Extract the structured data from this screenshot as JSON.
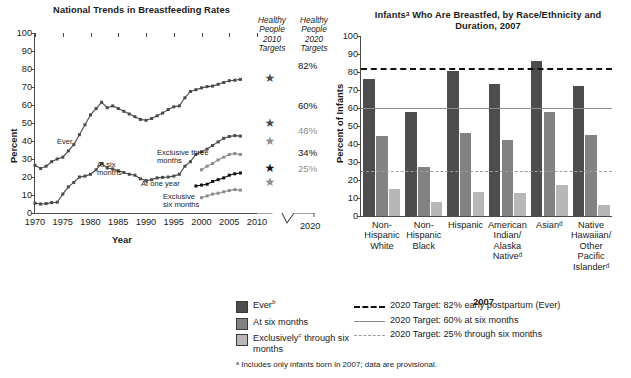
{
  "chart_data": [
    {
      "id": "left",
      "type": "line",
      "title": "National Trends in Breastfeeding Rates",
      "xlabel": "Year",
      "ylabel": "Percent",
      "ylim": [
        0,
        100
      ],
      "yticks": [
        0,
        10,
        20,
        30,
        40,
        50,
        60,
        70,
        80,
        90,
        100
      ],
      "xlim": [
        1970,
        2010
      ],
      "xticks": [
        1970,
        1975,
        1980,
        1985,
        1990,
        1995,
        2000,
        2005,
        2010
      ],
      "axis_break_label": "2020",
      "grid": false,
      "legend": "inline-labels",
      "series": [
        {
          "name": "Ever",
          "label": "Ever",
          "color": "#4a4a4a",
          "x": [
            1970,
            1971,
            1972,
            1973,
            1974,
            1975,
            1976,
            1977,
            1978,
            1979,
            1980,
            1981,
            1982,
            1983,
            1984,
            1985,
            1986,
            1987,
            1988,
            1989,
            1990,
            1991,
            1992,
            1993,
            1994,
            1995,
            1996,
            1997,
            1998,
            1999,
            2000,
            2001,
            2002,
            2003,
            2004,
            2005,
            2006,
            2007
          ],
          "values": [
            26.5,
            24.7,
            26.0,
            28.5,
            30.0,
            31.0,
            34.5,
            38.0,
            43.5,
            49.0,
            54.5,
            58.0,
            61.5,
            58.5,
            59.5,
            58.0,
            56.5,
            55.0,
            53.5,
            52.0,
            51.5,
            52.5,
            54.0,
            55.5,
            57.5,
            59.0,
            59.5,
            64.0,
            67.5,
            68.5,
            69.5,
            70.2,
            70.5,
            71.5,
            72.5,
            73.5,
            73.8,
            74.2
          ]
        },
        {
          "name": "At six months",
          "label": "At six months",
          "color": "#4a4a4a",
          "x": [
            1970,
            1971,
            1972,
            1973,
            1974,
            1975,
            1976,
            1977,
            1978,
            1979,
            1980,
            1981,
            1982,
            1983,
            1984,
            1985,
            1986,
            1987,
            1988,
            1989,
            1990,
            1991,
            1992,
            1993,
            1994,
            1995,
            1996,
            1997,
            1998,
            1999,
            2000,
            2001,
            2002,
            2003,
            2004,
            2005,
            2006,
            2007
          ],
          "values": [
            5.5,
            5.0,
            5.2,
            5.8,
            6.0,
            10.5,
            14.5,
            17.0,
            20.0,
            20.5,
            21.5,
            24.0,
            27.5,
            25.0,
            24.5,
            23.5,
            22.5,
            21.5,
            21.0,
            19.0,
            18.0,
            18.5,
            19.5,
            19.8,
            20.0,
            20.5,
            21.5,
            26.0,
            28.5,
            32.5,
            34.0,
            35.5,
            37.5,
            39.5,
            41.5,
            42.5,
            43.0,
            42.7
          ]
        },
        {
          "name": "Exclusive three months",
          "label": "Exclusive three months",
          "color": "#8c8c8c",
          "x": [
            2000,
            2001,
            2002,
            2003,
            2004,
            2005,
            2006,
            2007
          ],
          "values": [
            24.0,
            26.0,
            27.5,
            29.5,
            31.0,
            32.5,
            33.0,
            32.5
          ]
        },
        {
          "name": "At one year",
          "label": "At one year",
          "color": "#111111",
          "x": [
            1999,
            2000,
            2001,
            2002,
            2003,
            2004,
            2005,
            2006,
            2007
          ],
          "values": [
            15.0,
            15.5,
            16.0,
            17.5,
            18.5,
            19.5,
            21.0,
            21.8,
            22.2
          ]
        },
        {
          "name": "Exclusive six months",
          "label": "Exclusive six months",
          "color": "#8c8c8c",
          "x": [
            2000,
            2001,
            2002,
            2003,
            2004,
            2005,
            2006,
            2007
          ],
          "values": [
            8.5,
            9.5,
            10.5,
            11.0,
            11.8,
            12.5,
            13.0,
            12.7
          ]
        }
      ],
      "target_columns": {
        "hp2010": {
          "label_lines": [
            "Healthy",
            "People",
            "2010",
            "Targets"
          ],
          "markers": [
            {
              "value": 75,
              "color": "#4a4a4a"
            },
            {
              "value": 50,
              "color": "#4a4a4a"
            },
            {
              "value": 40,
              "color": "#8c8c8c"
            },
            {
              "value": 25,
              "color": "#111111"
            },
            {
              "value": 17,
              "color": "#8c8c8c"
            }
          ]
        },
        "hp2020": {
          "label_lines": [
            "Healthy",
            "People",
            "2020",
            "Targets"
          ],
          "values": [
            {
              "text": "82%",
              "value": 82,
              "emph": "dark"
            },
            {
              "text": "60%",
              "value": 60,
              "emph": "dark"
            },
            {
              "text": "46%",
              "value": 46,
              "emph": "light"
            },
            {
              "text": "34%",
              "value": 34,
              "emph": "dark"
            },
            {
              "text": "25%",
              "value": 25,
              "emph": "light"
            }
          ]
        }
      }
    },
    {
      "id": "right",
      "type": "bar",
      "title_line1": "Infantsᵃ Who Are Breastfed, by Race/Ethnicity and",
      "title_line2": "Duration, 2007",
      "xlabel": "2007",
      "ylabel": "Percent of Infants",
      "ylim": [
        0,
        100
      ],
      "yticks": [
        0,
        10,
        20,
        30,
        40,
        50,
        60,
        70,
        80,
        90,
        100
      ],
      "grid": false,
      "categories": [
        {
          "lines": [
            "Non-",
            "Hispanic",
            "White"
          ]
        },
        {
          "lines": [
            "Non-",
            "Hispanic",
            "Black"
          ]
        },
        {
          "lines": [
            "Hispanic"
          ]
        },
        {
          "lines": [
            "American",
            "Indian/",
            "Alaska",
            "Nativeᵈ"
          ]
        },
        {
          "lines": [
            "Asianᵈ"
          ]
        },
        {
          "lines": [
            "Native",
            "Hawaiian/",
            "Other",
            "Pacific",
            "Islanderᵈ"
          ]
        }
      ],
      "series": [
        {
          "name": "Ever",
          "color": "#4d4d4d",
          "values": [
            76,
            58,
            80.5,
            73.5,
            86,
            72
          ]
        },
        {
          "name": "At six months",
          "color": "#828282",
          "values": [
            44.5,
            27.5,
            46,
            42,
            58,
            45
          ]
        },
        {
          "name": "Exclusively through six months",
          "color": "#b7b7b7",
          "values": [
            15,
            8,
            13.5,
            13,
            17,
            6
          ]
        }
      ],
      "target_lines": [
        {
          "value": 82,
          "style": "dashed-heavy",
          "color": "#111111"
        },
        {
          "value": 60,
          "style": "solid",
          "color": "#8c8c8c"
        },
        {
          "value": 25,
          "style": "dashed-light",
          "color": "#9d9d9d"
        }
      ]
    }
  ],
  "legend": {
    "swatches": [
      {
        "label_html": "Ever<sup>b</sup>",
        "color": "#4d4d4d"
      },
      {
        "label_html": "At six months",
        "color": "#828282"
      },
      {
        "label_html": "Exclusively<sup>c</sup> through six months",
        "color": "#b7b7b7"
      }
    ],
    "lines": [
      {
        "text": "2020 Target: 82% early postpartum (Ever)",
        "style": "dashed-heavy"
      },
      {
        "text": "2020 Target: 60% at six months",
        "style": "solid"
      },
      {
        "text": "2020 Target: 25% through six months",
        "style": "dashed-light"
      }
    ]
  },
  "footnote": "ᵃ Includes only infants born in 2007; data are provisional."
}
